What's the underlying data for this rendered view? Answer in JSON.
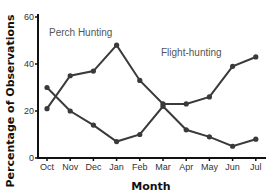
{
  "chart_data": {
    "type": "line",
    "title": "",
    "xlabel": "Month",
    "ylabel": "Percentage of Observations",
    "categories": [
      "Oct",
      "Nov",
      "Dec",
      "Jan",
      "Feb",
      "Mar",
      "Apr",
      "May",
      "Jun",
      "Jul"
    ],
    "yticks": [
      0,
      20,
      40,
      60
    ],
    "ylim": [
      0,
      62
    ],
    "grid": false,
    "legend": "none (inline annotations)",
    "series": [
      {
        "name": "Perch Hunting",
        "values": [
          21,
          35,
          37,
          48,
          33,
          23,
          23,
          26,
          39,
          43
        ]
      },
      {
        "name": "Flight-hunting",
        "values": [
          30,
          20,
          14,
          7,
          10,
          22,
          12,
          9,
          5,
          8
        ]
      }
    ],
    "annotations": [
      {
        "text": "Perch Hunting",
        "near": "Nov-Dec, y≈50"
      },
      {
        "text": "Flight-hunting",
        "near": "Feb-Apr, y≈43"
      }
    ]
  },
  "labels": {
    "xlabel": "Month",
    "ylabel": "Percentage of Observations",
    "perch": "Perch Hunting",
    "flight": "Flight-hunting"
  },
  "style": {
    "line_color": "#3a3a3a",
    "axis_color": "#111111"
  }
}
